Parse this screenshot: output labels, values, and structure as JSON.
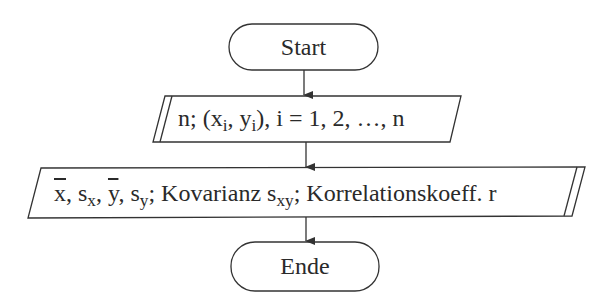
{
  "diagram": {
    "type": "flowchart",
    "nodes": {
      "start": {
        "shape": "terminal",
        "label": "Start"
      },
      "input": {
        "shape": "input-parallelogram",
        "parts": {
          "n": "n; (x",
          "sub_i1": "i",
          "mid": ", y",
          "sub_i2": "i",
          "rest": "), i = 1, 2, …, n"
        },
        "label": "n; (x_i, y_i), i = 1, 2, …, n"
      },
      "output": {
        "shape": "output-parallelogram",
        "parts": {
          "xbar": "x",
          "sep1": ", s",
          "sub_x": "x",
          "sep2": ", ",
          "ybar": "y",
          "sep3": ", s",
          "sub_y": "y",
          "kov": "; Kovarianz s",
          "sub_xy": "xy",
          "korr": "; Korrelationskoeff. r"
        },
        "label": "x̄, s_x, ȳ, s_y; Kovarianz s_xy; Korrelationskoeff. r"
      },
      "end": {
        "shape": "terminal",
        "label": "Ende"
      }
    },
    "edges": [
      {
        "from": "start",
        "to": "input"
      },
      {
        "from": "input",
        "to": "output"
      },
      {
        "from": "output",
        "to": "end"
      }
    ],
    "colors": {
      "stroke": "#333333",
      "text": "#2a2a2a",
      "background": "#ffffff"
    }
  }
}
